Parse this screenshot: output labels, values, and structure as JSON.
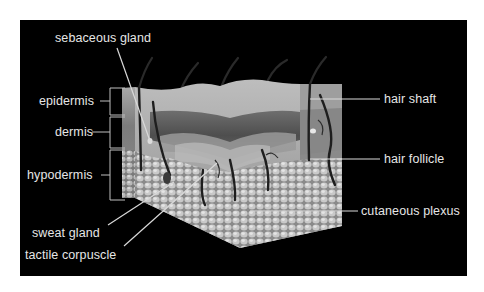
{
  "figure": {
    "colors": {
      "background": "#ffffff",
      "panel": "#000000",
      "label_text": "#e6e6e6",
      "leader_line": "#d9d9d9"
    }
  },
  "labels": {
    "sebaceous_gland": "sebaceous gland",
    "epidermis": "epidermis",
    "dermis": "dermis",
    "hypodermis": "hypodermis",
    "sweat_gland": "sweat gland",
    "tactile_corpuscle": "tactile corpuscle",
    "hair_shaft": "hair shaft",
    "hair_follicle": "hair follicle",
    "cutaneous_plexus": "cutaneous plexus"
  }
}
